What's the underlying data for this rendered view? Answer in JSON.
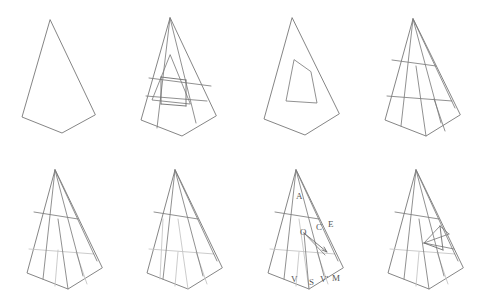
{
  "figure": {
    "panel_count": 8,
    "rows": 2,
    "columns": 4,
    "background_color": "#ffffff",
    "line_color": "#777777",
    "light_line_color": "#c3c3c3",
    "canvas": {
      "width": 478,
      "height": 298
    }
  },
  "panels": [
    {
      "id": "panel-1",
      "index": 1,
      "caption": "Base outline",
      "description": "Plain pentagonal kite outline with apex at top and a shallow V-shaped base.",
      "origin": {
        "x": 0,
        "y": 0
      },
      "outline": "M50,20 L22,117 L62,133 L95,115 Z",
      "inner_paths": [],
      "light_paths": [],
      "accent_paths": [],
      "labels": []
    },
    {
      "id": "panel-2",
      "index": 2,
      "caption": "Outline with inner triangle and overlapping band",
      "description": "Same outline with a nested inner triangle, a horizontal band and two vertical chords forming overlapping rectangles.",
      "origin": {
        "x": 120,
        "y": 0
      },
      "outline": "M170,18 L141,120 L182,136 L216,116 Z",
      "inner_paths": [
        "M170,18 L157,128",
        "M170,18 L196,123",
        "M170,55 L152,100 L190,104 Z",
        "M149,78 L211,86",
        "M146,96 L207,101"
      ],
      "light_paths": [],
      "accent_paths": [
        "M161,77 L161,104",
        "M186,80 L186,106",
        "M161,77 L186,80",
        "M161,104 L186,106"
      ],
      "labels": []
    },
    {
      "id": "panel-3",
      "index": 3,
      "caption": "Outline with interior void",
      "description": "Same outline containing a small quadrilateral hole positioned left of centre.",
      "origin": {
        "x": 240,
        "y": 0
      },
      "outline": "M292,18 L264,119 L305,135 L339,114 Z",
      "inner_paths": [
        "M294,60 L286,101 L317,103 L311,72 Z"
      ],
      "light_paths": [],
      "accent_paths": [],
      "labels": []
    },
    {
      "id": "panel-4",
      "index": 4,
      "caption": "Four-cell subdivision",
      "description": "Outline fully subdivided by two horizontal bands and three descending chords into a grid of quadrilateral cells.",
      "origin": {
        "x": 360,
        "y": 0
      },
      "outline": "M413,19 L385,120 L426,136 L460,115 Z",
      "inner_paths": [
        "M413,19 L401,126",
        "M413,19 L441,123",
        "M392,60 L436,66",
        "M387,96 L452,101",
        "M413,19 L455,108",
        "M416,66 L426,136",
        "M434,99 L445,131"
      ],
      "light_paths": [],
      "accent_paths": [],
      "labels": []
    },
    {
      "id": "panel-5",
      "index": 5,
      "caption": "Subdivision with lighter interior edges",
      "description": "Grid subdivision where some of the interior edges are drawn in a lighter grey tone.",
      "origin": {
        "x": 0,
        "y": 149
      },
      "outline": "M55,170 L27,273 L68,289 L102,268 Z",
      "inner_paths": [
        "M55,170 L43,279",
        "M55,170 L83,276",
        "M34,212 L78,219",
        "M55,170 L97,261",
        "M58,219 L68,289"
      ],
      "light_paths": [
        "M29,249 L94,254",
        "M76,252 L87,284",
        "M58,250 L55,286"
      ],
      "accent_paths": [],
      "labels": []
    },
    {
      "id": "panel-6",
      "index": 6,
      "caption": "Subdivision with more light edges",
      "description": "Same grid as the previous panel with additional interior edges rendered in light grey.",
      "origin": {
        "x": 120,
        "y": 149
      },
      "outline": "M175,170 L147,273 L188,289 L222,268 Z",
      "inner_paths": [
        "M175,170 L163,279",
        "M175,170 L203,276",
        "M154,212 L198,219",
        "M175,170 L217,261"
      ],
      "light_paths": [
        "M149,249 L214,254",
        "M178,219 L188,289",
        "M196,252 L207,284",
        "M178,252 L175,286",
        "M163,219 L160,279"
      ],
      "accent_paths": [],
      "labels": []
    },
    {
      "id": "panel-7",
      "index": 7,
      "caption": "Labelled construction",
      "description": "Subdivided outline annotated with the construction points A, O, C, E, V, S, V prime and M, plus a short arrow from O toward C.",
      "origin": {
        "x": 240,
        "y": 149
      },
      "outline": "M296,170 L268,273 L309,289 L343,268 Z",
      "inner_paths": [
        "M296,170 L284,279",
        "M296,170 L324,276",
        "M275,212 L319,219",
        "M296,170 L338,261",
        "M304,233 L309,289",
        "M304,233 L325,255"
      ],
      "light_paths": [
        "M270,249 L335,254",
        "M299,219 L309,289",
        "M317,252 L328,284",
        "M299,252 L296,286"
      ],
      "accent_paths": [
        "M304,233 L327,252",
        "M322,250 L327,252 L324,247"
      ],
      "labels": [
        {
          "text": "A",
          "x": 296,
          "y": 199
        },
        {
          "text": "O",
          "x": 300,
          "y": 235
        },
        {
          "text": "C",
          "x": 316,
          "y": 230
        },
        {
          "text": "E",
          "x": 328,
          "y": 227
        },
        {
          "text": "V",
          "x": 291,
          "y": 282
        },
        {
          "text": "S",
          "x": 309,
          "y": 285
        },
        {
          "text": "V'",
          "x": 320,
          "y": 282
        },
        {
          "text": "M",
          "x": 332,
          "y": 281
        }
      ]
    },
    {
      "id": "panel-8",
      "index": 8,
      "caption": "Subdivision with highlighted cell",
      "description": "Subdivided outline with one small quadrilateral cell on the right side picked out by extra edges.",
      "origin": {
        "x": 360,
        "y": 149
      },
      "outline": "M416,170 L388,273 L429,289 L463,268 Z",
      "inner_paths": [
        "M416,170 L404,279",
        "M416,170 L444,276",
        "M395,212 L439,219",
        "M416,170 L458,261",
        "M419,219 L429,289",
        "M424,243 L449,234",
        "M424,243 L454,249",
        "M440,226 L449,234",
        "M424,243 L440,226"
      ],
      "light_paths": [
        "M390,249 L455,254",
        "M437,252 L448,284",
        "M419,252 L416,286"
      ],
      "accent_paths": [
        "M440,226 L443,250",
        "M424,243 L443,250"
      ],
      "labels": []
    }
  ]
}
